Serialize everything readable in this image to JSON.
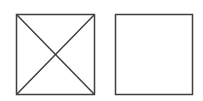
{
  "diagram": {
    "stroke_color": "#3f3f3f",
    "background": "#ffffff",
    "shapes": [
      {
        "name": "crossed-square",
        "x": 16,
        "y": 14,
        "w": 78,
        "h": 80,
        "diagonals": true
      },
      {
        "name": "empty-square",
        "x": 115,
        "y": 14,
        "w": 77,
        "h": 80,
        "diagonals": false
      }
    ]
  }
}
